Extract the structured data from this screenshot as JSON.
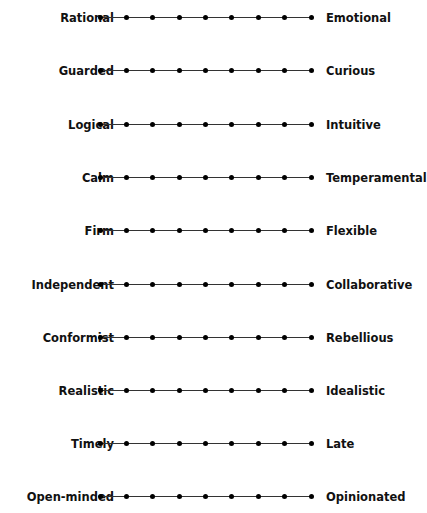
{
  "scale_points": 9,
  "rows": [
    {
      "left": "Rational",
      "right": "Emotional"
    },
    {
      "left": "Guarded",
      "right": "Curious"
    },
    {
      "left": "Logical",
      "right": "Intuitive"
    },
    {
      "left": "Calm",
      "right": "Temperamental"
    },
    {
      "left": "Firm",
      "right": "Flexible"
    },
    {
      "left": "Independent",
      "right": "Collaborative"
    },
    {
      "left": "Conformist",
      "right": "Rebellious"
    },
    {
      "left": "Realistic",
      "right": "Idealistic"
    },
    {
      "left": "Timely",
      "right": "Late"
    },
    {
      "left": "Open-minded",
      "right": "Opinionated"
    }
  ]
}
